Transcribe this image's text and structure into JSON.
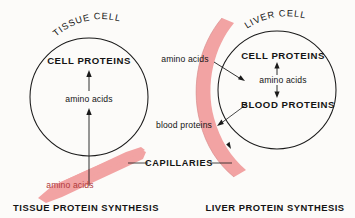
{
  "diagram": {
    "background_color": "#fcfbf9",
    "ink_color": "#141414",
    "capillary_color": "#f2a3a3",
    "capillary_text_color": "#b03a3a"
  },
  "tissue_panel": {
    "cell_name": "TISSUE CELL",
    "internal_product": "CELL PROTEINS",
    "internal_substrate": "amino acids",
    "capillary_substrate": "amino acids",
    "caption": "TISSUE PROTEIN SYNTHESIS"
  },
  "liver_panel": {
    "cell_name": "LIVER CELL",
    "internal_product_top": "CELL PROTEINS",
    "internal_substrate": "amino acids",
    "internal_product_bottom": "BLOOD PROTEINS",
    "capillary_substrate": "amino acids",
    "capillary_product": "blood proteins",
    "caption": "LIVER PROTEIN SYNTHESIS"
  },
  "shared": {
    "capillaries_label": "CAPILLARIES"
  }
}
